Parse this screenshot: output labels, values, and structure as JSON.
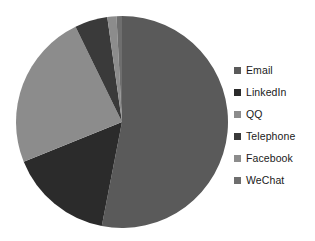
{
  "chart_data": {
    "type": "pie",
    "title": "",
    "subtitle": "",
    "xlabel": "",
    "ylabel": "",
    "grid": false,
    "legend_position": "right",
    "categories": [
      "Email",
      "LinkedIn",
      "QQ",
      "Telephone",
      "Facebook",
      "WeChat"
    ],
    "values": [
      53,
      16,
      24,
      5,
      2,
      1
    ],
    "units": "percent",
    "start_angle_deg": 0,
    "direction": "clockwise",
    "slices": [
      {
        "label": "Email",
        "value": 53,
        "color": "#5a5a5a",
        "start_deg": 0,
        "end_deg": 191
      },
      {
        "label": "LinkedIn",
        "value": 16,
        "color": "#2b2b2b",
        "start_deg": 191,
        "end_deg": 248
      },
      {
        "label": "QQ",
        "value": 24,
        "color": "#8c8c8c",
        "start_deg": 248,
        "end_deg": 334
      },
      {
        "label": "Telephone",
        "value": 5,
        "color": "#3a3a3a",
        "start_deg": 334,
        "end_deg": 352
      },
      {
        "label": "Facebook",
        "value": 2,
        "color": "#8c8c8c",
        "start_deg": 352,
        "end_deg": 357
      },
      {
        "label": "WeChat",
        "value": 1,
        "color": "#6e6e6e",
        "start_deg": 357,
        "end_deg": 360
      }
    ]
  },
  "legend": {
    "items": [
      {
        "label": "Email",
        "color": "#5a5a5a"
      },
      {
        "label": "LinkedIn",
        "color": "#2b2b2b"
      },
      {
        "label": "QQ",
        "color": "#8c8c8c"
      },
      {
        "label": "Telephone",
        "color": "#3a3a3a"
      },
      {
        "label": "Facebook",
        "color": "#8c8c8c"
      },
      {
        "label": "WeChat",
        "color": "#6e6e6e"
      }
    ]
  },
  "pie_geometry": {
    "cx": 108,
    "cy": 108,
    "r": 106
  }
}
